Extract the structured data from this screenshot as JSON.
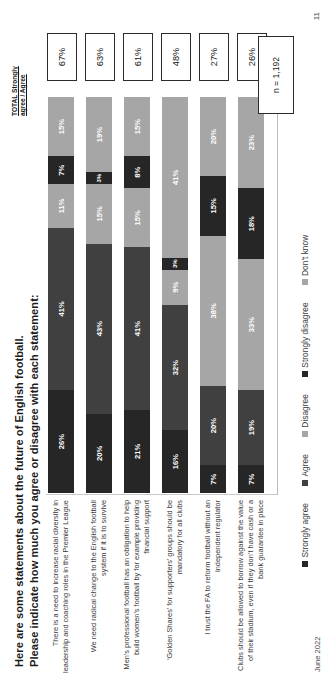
{
  "slide": {
    "title_line1": "Here are some statements about the future of English football.",
    "title_line2": "Please indicate how much you agree or disagree with each statement:",
    "total_header_line1": "TOTAL Strongly",
    "total_header_line2": "agree / Agree",
    "sample_size": "n = 1,192",
    "date": "June 2022",
    "page_number": "11"
  },
  "legend": [
    {
      "label": "Strongly agree",
      "color": "#262626"
    },
    {
      "label": "Agree",
      "color": "#404040"
    },
    {
      "label": "Disagree",
      "color": "#a6a6a6"
    },
    {
      "label": "Strongly disagree",
      "color": "#262626"
    },
    {
      "label": "Don't know",
      "color": "#a6a6a6"
    }
  ],
  "chart_data": {
    "type": "bar",
    "subtype": "stacked-horizontal-100",
    "title": "Here are some statements about the future of English football. Please indicate how much you agree or disagree with each statement:",
    "xlabel": "",
    "ylabel": "",
    "xlim": [
      0,
      100
    ],
    "grid": false,
    "legend_position": "bottom",
    "categories": [
      "There is a need to increase racial diversity in leadership and coaching roles in the Premier League",
      "We need radical change to the English football system if it is to survive",
      "Men's professional football has an obligation to help build women's football by for example providing financial support",
      "‘Golden Shares’ for supporters’ groups should be mandatory for all clubs",
      "I trust the FA to reform football without an independent regulator",
      "Clubs should be allowed to borrow against the value of their stadium, even if they don’t have cash or a bank guarantee in place"
    ],
    "series": [
      {
        "name": "Strongly agree",
        "color": "#262626",
        "values": [
          26,
          20,
          21,
          16,
          7,
          7
        ]
      },
      {
        "name": "Agree",
        "color": "#404040",
        "values": [
          41,
          43,
          41,
          32,
          20,
          19
        ]
      },
      {
        "name": "Disagree",
        "color": "#a6a6a6",
        "values": [
          11,
          15,
          15,
          9,
          38,
          33
        ]
      },
      {
        "name": "Strongly disagree",
        "color": "#262626",
        "values": [
          7,
          3,
          8,
          3,
          15,
          18
        ]
      },
      {
        "name": "Don't know",
        "color": "#a6a6a6",
        "values": [
          15,
          19,
          15,
          41,
          20,
          23
        ]
      }
    ],
    "total_agree": [
      "67%",
      "63%",
      "61%",
      "48%",
      "27%",
      "26%"
    ],
    "annotations": [
      "n = 1,192"
    ]
  },
  "rows": [
    {
      "label": "There is a need to increase racial diversity in leadership and coaching roles in the Premier League",
      "total": "67%",
      "segments": [
        {
          "name": "Strongly agree",
          "value": 26,
          "text": "26%",
          "color": "#262626"
        },
        {
          "name": "Agree",
          "value": 41,
          "text": "41%",
          "color": "#404040"
        },
        {
          "name": "Disagree",
          "value": 11,
          "text": "11%",
          "color": "#a6a6a6"
        },
        {
          "name": "Strongly disagree",
          "value": 7,
          "text": "7%",
          "color": "#262626"
        },
        {
          "name": "Don't know",
          "value": 15,
          "text": "15%",
          "color": "#a6a6a6"
        }
      ]
    },
    {
      "label": "We need radical change to the English football system if it is to survive",
      "total": "63%",
      "segments": [
        {
          "name": "Strongly agree",
          "value": 20,
          "text": "20%",
          "color": "#262626"
        },
        {
          "name": "Agree",
          "value": 43,
          "text": "43%",
          "color": "#404040"
        },
        {
          "name": "Disagree",
          "value": 15,
          "text": "15%",
          "color": "#a6a6a6"
        },
        {
          "name": "Strongly disagree",
          "value": 3,
          "text": "3%",
          "color": "#262626"
        },
        {
          "name": "Don't know",
          "value": 19,
          "text": "19%",
          "color": "#a6a6a6"
        }
      ]
    },
    {
      "label": "Men's professional football has an obligation to help build women's football by for example providing financial support",
      "total": "61%",
      "segments": [
        {
          "name": "Strongly agree",
          "value": 21,
          "text": "21%",
          "color": "#262626"
        },
        {
          "name": "Agree",
          "value": 41,
          "text": "41%",
          "color": "#404040"
        },
        {
          "name": "Disagree",
          "value": 15,
          "text": "15%",
          "color": "#a6a6a6"
        },
        {
          "name": "Strongly disagree",
          "value": 8,
          "text": "8%",
          "color": "#262626"
        },
        {
          "name": "Don't know",
          "value": 15,
          "text": "15%",
          "color": "#a6a6a6"
        }
      ]
    },
    {
      "label": "‘Golden Shares’ for supporters’ groups should be mandatory for all clubs",
      "total": "48%",
      "segments": [
        {
          "name": "Strongly agree",
          "value": 16,
          "text": "16%",
          "color": "#262626"
        },
        {
          "name": "Agree",
          "value": 32,
          "text": "32%",
          "color": "#404040"
        },
        {
          "name": "Disagree",
          "value": 9,
          "text": "9%",
          "color": "#a6a6a6"
        },
        {
          "name": "Strongly disagree",
          "value": 3,
          "text": "3%",
          "color": "#262626"
        },
        {
          "name": "Don't know",
          "value": 41,
          "text": "41%",
          "color": "#a6a6a6"
        }
      ]
    },
    {
      "label": "I trust the FA to reform football without an independent regulator",
      "total": "27%",
      "segments": [
        {
          "name": "Strongly agree",
          "value": 7,
          "text": "7%",
          "color": "#262626"
        },
        {
          "name": "Agree",
          "value": 20,
          "text": "20%",
          "color": "#404040"
        },
        {
          "name": "Disagree",
          "value": 38,
          "text": "38%",
          "color": "#a6a6a6"
        },
        {
          "name": "Strongly disagree",
          "value": 15,
          "text": "15%",
          "color": "#262626"
        },
        {
          "name": "Don't know",
          "value": 20,
          "text": "20%",
          "color": "#a6a6a6"
        }
      ]
    },
    {
      "label": "Clubs should be allowed to borrow against the value of their stadium, even if they don’t have cash or a bank guarantee in place",
      "total": "26%",
      "segments": [
        {
          "name": "Strongly agree",
          "value": 7,
          "text": "7%",
          "color": "#262626"
        },
        {
          "name": "Agree",
          "value": 19,
          "text": "19%",
          "color": "#404040"
        },
        {
          "name": "Disagree",
          "value": 33,
          "text": "33%",
          "color": "#a6a6a6"
        },
        {
          "name": "Strongly disagree",
          "value": 18,
          "text": "18%",
          "color": "#262626"
        },
        {
          "name": "Don't know",
          "value": 23,
          "text": "23%",
          "color": "#a6a6a6"
        }
      ]
    }
  ]
}
